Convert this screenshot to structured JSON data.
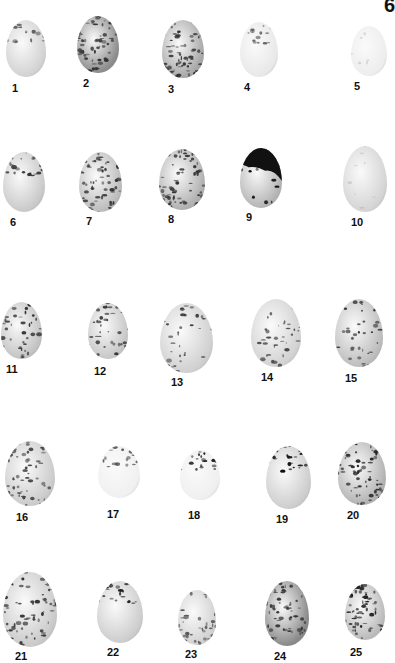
{
  "plate": {
    "number": "6"
  },
  "eggs": [
    {
      "label": "1",
      "x": 6,
      "y": 20,
      "w": 40,
      "h": 57,
      "base": "#d2d2d2",
      "spot": "#555",
      "density": "light-cap",
      "lx": 12,
      "ly": 82
    },
    {
      "label": "2",
      "x": 77,
      "y": 16,
      "w": 42,
      "h": 57,
      "base": "#8d8d8d",
      "spot": "#333",
      "density": "heavy",
      "lx": 83,
      "ly": 77
    },
    {
      "label": "3",
      "x": 162,
      "y": 20,
      "w": 42,
      "h": 58,
      "base": "#a8a8a8",
      "spot": "#333",
      "density": "heavy",
      "lx": 168,
      "ly": 83
    },
    {
      "label": "4",
      "x": 240,
      "y": 22,
      "w": 38,
      "h": 55,
      "base": "#e8e8e8",
      "spot": "#666",
      "density": "light-cap",
      "lx": 244,
      "ly": 81
    },
    {
      "label": "5",
      "x": 351,
      "y": 26,
      "w": 36,
      "h": 50,
      "base": "#ededed",
      "spot": "#999",
      "density": "faint",
      "lx": 354,
      "ly": 80
    },
    {
      "label": "6",
      "x": 3,
      "y": 152,
      "w": 42,
      "h": 60,
      "base": "#c9c9c9",
      "spot": "#333",
      "density": "cap",
      "lx": 10,
      "ly": 216
    },
    {
      "label": "7",
      "x": 79,
      "y": 152,
      "w": 43,
      "h": 60,
      "base": "#bcbcbc",
      "spot": "#333",
      "density": "heavy",
      "lx": 86,
      "ly": 215
    },
    {
      "label": "8",
      "x": 159,
      "y": 149,
      "w": 46,
      "h": 61,
      "base": "#b0b0b0",
      "spot": "#333",
      "density": "heavy",
      "lx": 168,
      "ly": 213
    },
    {
      "label": "9",
      "x": 240,
      "y": 148,
      "w": 42,
      "h": 60,
      "base": "#b5b5b5",
      "spot": "#111",
      "density": "dark-cap",
      "lx": 246,
      "ly": 211
    },
    {
      "label": "10",
      "x": 343,
      "y": 146,
      "w": 44,
      "h": 66,
      "base": "#d4d4d4",
      "spot": "#999",
      "density": "faint",
      "lx": 351,
      "ly": 216
    },
    {
      "label": "11",
      "x": 1,
      "y": 302,
      "w": 41,
      "h": 57,
      "base": "#c3c3c3",
      "spot": "#333",
      "density": "medium",
      "lx": 6,
      "ly": 363
    },
    {
      "label": "12",
      "x": 88,
      "y": 303,
      "w": 40,
      "h": 56,
      "base": "#c7c7c7",
      "spot": "#333",
      "density": "medium",
      "lx": 94,
      "ly": 365
    },
    {
      "label": "13",
      "x": 160,
      "y": 303,
      "w": 53,
      "h": 70,
      "base": "#d0d0d0",
      "spot": "#333",
      "density": "medium",
      "lx": 171,
      "ly": 376
    },
    {
      "label": "14",
      "x": 251,
      "y": 299,
      "w": 50,
      "h": 68,
      "base": "#d2d2d2",
      "spot": "#444",
      "density": "medium",
      "lx": 261,
      "ly": 371
    },
    {
      "label": "15",
      "x": 335,
      "y": 299,
      "w": 48,
      "h": 68,
      "base": "#bdbdbd",
      "spot": "#333",
      "density": "medium",
      "lx": 345,
      "ly": 372
    },
    {
      "label": "16",
      "x": 5,
      "y": 441,
      "w": 50,
      "h": 65,
      "base": "#cbcbcb",
      "spot": "#444",
      "density": "heavy",
      "lx": 16,
      "ly": 511
    },
    {
      "label": "17",
      "x": 98,
      "y": 446,
      "w": 42,
      "h": 52,
      "base": "#f0f0f0",
      "spot": "#444",
      "density": "light-cap",
      "lx": 107,
      "ly": 508
    },
    {
      "label": "18",
      "x": 180,
      "y": 450,
      "w": 40,
      "h": 50,
      "base": "#efefef",
      "spot": "#222",
      "density": "light-cap",
      "lx": 188,
      "ly": 509
    },
    {
      "label": "19",
      "x": 266,
      "y": 446,
      "w": 45,
      "h": 63,
      "base": "#cdcdcd",
      "spot": "#111",
      "density": "cap",
      "lx": 276,
      "ly": 513
    },
    {
      "label": "20",
      "x": 338,
      "y": 442,
      "w": 48,
      "h": 63,
      "base": "#b3b3b3",
      "spot": "#222",
      "density": "heavy",
      "lx": 347,
      "ly": 509
    },
    {
      "label": "21",
      "x": 3,
      "y": 572,
      "w": 54,
      "h": 75,
      "base": "#cacaca",
      "spot": "#333",
      "density": "heavy",
      "lx": 15,
      "ly": 650
    },
    {
      "label": "22",
      "x": 97,
      "y": 581,
      "w": 46,
      "h": 62,
      "base": "#cdcdcd",
      "spot": "#222",
      "density": "cap",
      "lx": 107,
      "ly": 646
    },
    {
      "label": "23",
      "x": 178,
      "y": 590,
      "w": 38,
      "h": 55,
      "base": "#d2d2d2",
      "spot": "#555",
      "density": "medium",
      "lx": 185,
      "ly": 648
    },
    {
      "label": "24",
      "x": 265,
      "y": 581,
      "w": 44,
      "h": 65,
      "base": "#8a8a8a",
      "spot": "#333",
      "density": "heavy",
      "lx": 274,
      "ly": 650
    },
    {
      "label": "25",
      "x": 345,
      "y": 584,
      "w": 40,
      "h": 56,
      "base": "#bbbbbb",
      "spot": "#222",
      "density": "heavy",
      "lx": 350,
      "ly": 646
    }
  ]
}
